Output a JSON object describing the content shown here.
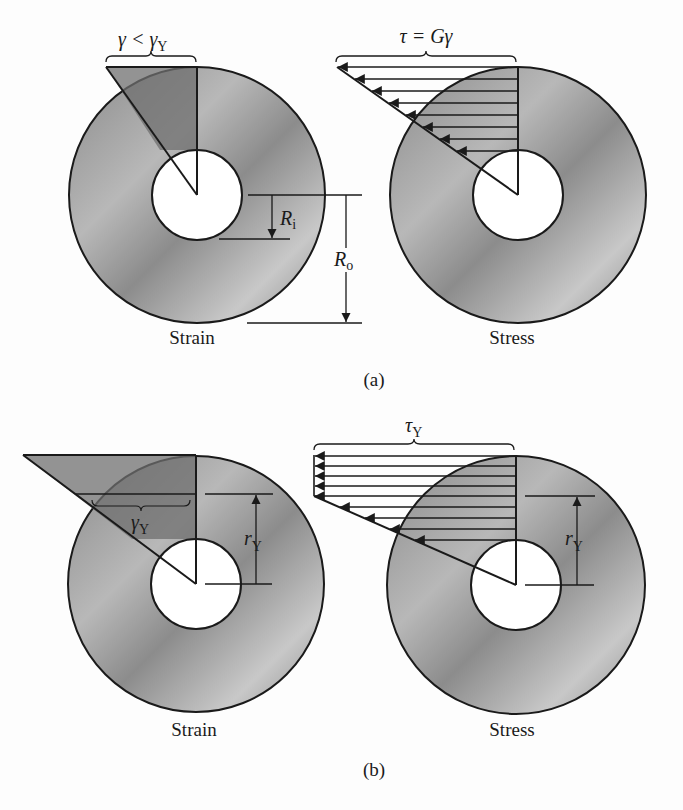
{
  "figure": {
    "colors": {
      "background": "#fdfdfd",
      "ink": "#1a1a1a",
      "ring_dark": "#7e7e7e",
      "ring_light": "#d6d6d6",
      "strain_fill": "#6f6f6f",
      "hole": "#ffffff"
    },
    "panel_a": {
      "caption": "(a)",
      "strain": {
        "label": "Strain",
        "brace_label_main": "γ < γ",
        "brace_label_sub": "Y",
        "ri_label_main": "R",
        "ri_label_sub": "i",
        "ro_label_main": "R",
        "ro_label_sub": "o"
      },
      "stress": {
        "label": "Stress",
        "brace_label": "τ = Gγ",
        "arrow_count": 8
      }
    },
    "panel_b": {
      "caption": "(b)",
      "strain": {
        "label": "Strain",
        "brace_label_main": "γ",
        "brace_label_sub": "Y",
        "ry_label_main": "r",
        "ry_label_sub": "Y"
      },
      "stress": {
        "label": "Stress",
        "brace_label_main": "τ",
        "brace_label_sub": "Y",
        "ry_label_main": "r",
        "ry_label_sub": "Y",
        "plastic_arrow_count": 5,
        "elastic_arrow_count": 4
      }
    }
  }
}
